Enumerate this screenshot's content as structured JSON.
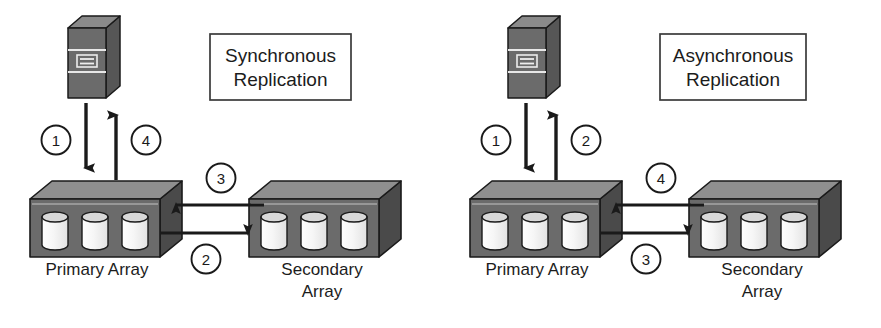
{
  "canvas": {
    "width": 881,
    "height": 328,
    "background": "#ffffff"
  },
  "palette": {
    "stroke": "#1a1a1a",
    "box_front": "#6b6b6b",
    "box_top": "#8f8f8f",
    "box_side": "#4a4a4a",
    "disk_body": "#f2f2f2",
    "disk_top": "#d8d8d8",
    "host_front": "#6b6b6b",
    "host_top": "#8a8a8a",
    "host_side": "#565656",
    "text": "#1c1c1c",
    "label_box_border": "#3a3a3a",
    "label_box_fill": "#ffffff"
  },
  "diagrams": [
    {
      "id": "synchronous",
      "title_lines": [
        "Synchronous",
        "Replication"
      ],
      "host": {
        "name": "host-server",
        "slot_icon": "server-slot-icon"
      },
      "primary_array": {
        "caption_lines": [
          "Primary Array"
        ],
        "disk_count": 3
      },
      "secondary_array": {
        "caption_lines": [
          "Secondary",
          "Array"
        ],
        "disk_count": 3
      },
      "steps": [
        {
          "id": "s1",
          "number": "1",
          "direction": "host-to-primary",
          "orientation": "vertical-down"
        },
        {
          "id": "s2",
          "number": "2",
          "direction": "primary-to-secondary",
          "orientation": "horizontal-right"
        },
        {
          "id": "s3",
          "number": "3",
          "direction": "secondary-to-primary",
          "orientation": "horizontal-left"
        },
        {
          "id": "s4",
          "number": "4",
          "direction": "primary-to-host",
          "orientation": "vertical-up"
        }
      ]
    },
    {
      "id": "asynchronous",
      "title_lines": [
        "Asynchronous",
        "Replication"
      ],
      "host": {
        "name": "host-server",
        "slot_icon": "server-slot-icon"
      },
      "primary_array": {
        "caption_lines": [
          "Primary Array"
        ],
        "disk_count": 3
      },
      "secondary_array": {
        "caption_lines": [
          "Secondary",
          "Array"
        ],
        "disk_count": 3
      },
      "steps": [
        {
          "id": "a1",
          "number": "1",
          "direction": "host-to-primary",
          "orientation": "vertical-down"
        },
        {
          "id": "a2",
          "number": "2",
          "direction": "primary-to-host",
          "orientation": "vertical-up"
        },
        {
          "id": "a3",
          "number": "3",
          "direction": "primary-to-secondary",
          "orientation": "horizontal-right"
        },
        {
          "id": "a4",
          "number": "4",
          "direction": "secondary-to-primary",
          "orientation": "horizontal-left"
        }
      ]
    }
  ]
}
